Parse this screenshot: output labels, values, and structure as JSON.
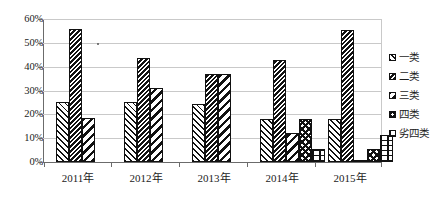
{
  "chart_data": {
    "type": "bar",
    "title": "",
    "subtitle": "",
    "xlabel": "",
    "ylabel": "",
    "categories": [
      "2011年",
      "2012年",
      "2013年",
      "2014年",
      "2015年"
    ],
    "series": [
      {
        "name": "一类",
        "values": [
          25.0,
          25.0,
          24.5,
          18.0,
          18.0
        ]
      },
      {
        "name": "二类",
        "values": [
          56.0,
          43.5,
          37.0,
          43.0,
          55.5
        ]
      },
      {
        "name": "三类",
        "values": [
          18.5,
          31.0,
          37.0,
          12.0,
          0.5
        ]
      },
      {
        "name": "四类",
        "values": [
          0,
          0,
          0,
          18.0,
          5.5
        ]
      },
      {
        "name": "劣四类",
        "values": [
          0,
          0,
          0,
          5.5,
          11.5
        ]
      }
    ],
    "ylim": [
      0,
      60
    ],
    "ytick_values": [
      0,
      10,
      20,
      30,
      40,
      50,
      60
    ],
    "ytick_labels": [
      "0%",
      "10%",
      "20%",
      "30%",
      "40%",
      "50%",
      "60%"
    ],
    "yunit": "%",
    "grid": true,
    "legend_position": "right",
    "annotations": []
  },
  "axes": {
    "y": {
      "ticks": [
        {
          "label": "60%",
          "value": 60
        },
        {
          "label": "50%",
          "value": 50
        },
        {
          "label": "40%",
          "value": 40
        },
        {
          "label": "30%",
          "value": 30
        },
        {
          "label": "20%",
          "value": 20
        },
        {
          "label": "10%",
          "value": 10
        },
        {
          "label": "0%",
          "value": 0
        }
      ]
    },
    "x": {
      "ticks": [
        {
          "label": "2011年"
        },
        {
          "label": "2012年"
        },
        {
          "label": "2013年"
        },
        {
          "label": "2014年"
        },
        {
          "label": "2015年"
        }
      ]
    }
  },
  "legend": {
    "items": [
      {
        "label": "一类",
        "pattern": "diagonal-hatch-light",
        "color": "#111111"
      },
      {
        "label": "二类",
        "pattern": "diagonal-hatch-dense",
        "color": "#111111"
      },
      {
        "label": "三类",
        "pattern": "diagonal-stripe-wide",
        "color": "#111111"
      },
      {
        "label": "四类",
        "pattern": "chevron",
        "color": "#111111"
      },
      {
        "label": "劣四类",
        "pattern": "brick-grid",
        "color": "#111111"
      }
    ]
  },
  "colors": {
    "ink": "#111111",
    "grid": "#c9c9c9",
    "axis": "#6b6b6b",
    "background": "#ffffff"
  }
}
